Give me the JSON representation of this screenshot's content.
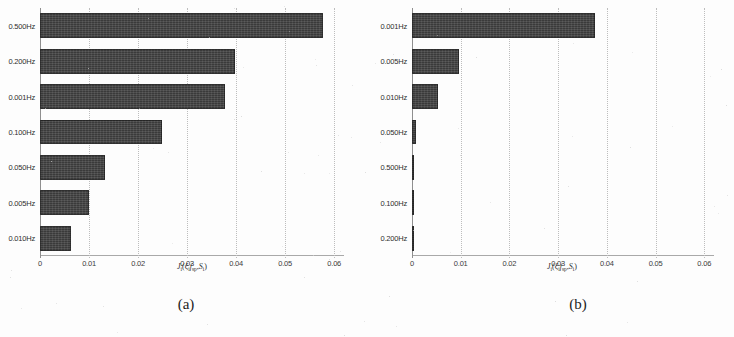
{
  "figure": {
    "background_color": "#fdfdfd",
    "bar_color": "#3a3a3a",
    "grid_color": "#bdbdbd",
    "axis_color": "#8f8f8f"
  },
  "panels": [
    {
      "caption": "(a)",
      "xlabel_parts": {
        "j": "J",
        "jsub": "i",
        "open": "(",
        "xi": "ξ",
        "xisub": "i",
        "f": "f",
        "fsub": "sp",
        "comma": ",",
        "s": "S",
        "ssub": "i",
        "close": ")"
      },
      "xlabel_text": "J_i(ξ_i f_sp, S_i)",
      "chart_data": {
        "type": "bar",
        "orientation": "horizontal",
        "title": "(a)",
        "xlabel": "J_i(ξ_i f_sp, S_i)",
        "ylabel": "",
        "xlim": [
          0,
          0.062
        ],
        "xticks": [
          0,
          0.01,
          0.02,
          0.03,
          0.04,
          0.05,
          0.06
        ],
        "xticklabels": [
          "0",
          "0.01",
          "0.02",
          "0.03",
          "0.04",
          "0.05",
          "0.06"
        ],
        "grid": true,
        "legend": null,
        "categories": [
          "0.500Hz",
          "0.200Hz",
          "0.001Hz",
          "0.100Hz",
          "0.050Hz",
          "0.005Hz",
          "0.010Hz"
        ],
        "values": [
          0.0577,
          0.0397,
          0.0378,
          0.0249,
          0.0133,
          0.01,
          0.0064
        ]
      }
    },
    {
      "caption": "(b)",
      "xlabel_parts": {
        "j": "J",
        "jsub": "i",
        "open": "(",
        "xi": "ξ",
        "xisub": "i",
        "f": "f",
        "fsub": "sp",
        "comma": ",",
        "s": "S",
        "ssub": "i",
        "close": ")"
      },
      "xlabel_text": "J_i(ξ_i f_sp, S_i)",
      "chart_data": {
        "type": "bar",
        "orientation": "horizontal",
        "title": "(b)",
        "xlabel": "J_i(ξ_i f_sp, S_i)",
        "ylabel": "",
        "xlim": [
          0,
          0.062
        ],
        "xticks": [
          0,
          0.01,
          0.02,
          0.03,
          0.04,
          0.05,
          0.06
        ],
        "xticklabels": [
          "0",
          "0.01",
          "0.02",
          "0.03",
          "0.04",
          "0.05",
          "0.06"
        ],
        "grid": true,
        "legend": null,
        "categories": [
          "0.001Hz",
          "0.005Hz",
          "0.010Hz",
          "0.050Hz",
          "0.500Hz",
          "0.100Hz",
          "0.200Hz"
        ],
        "values": [
          0.0375,
          0.0096,
          0.0053,
          0.0008,
          0.0005,
          0.0005,
          0.0004
        ]
      }
    }
  ]
}
